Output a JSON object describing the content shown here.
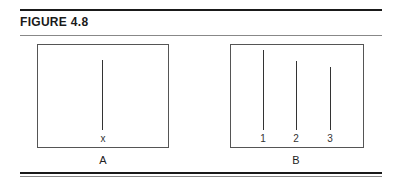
{
  "figure": {
    "title": "FIGURE 4.8",
    "panels": [
      {
        "caption": "A",
        "lines": [
          {
            "label": "x",
            "relative_height": 70
          }
        ]
      },
      {
        "caption": "B",
        "lines": [
          {
            "label": "1",
            "relative_height": 80
          },
          {
            "label": "2",
            "relative_height": 69
          },
          {
            "label": "3",
            "relative_height": 63
          }
        ]
      }
    ]
  }
}
